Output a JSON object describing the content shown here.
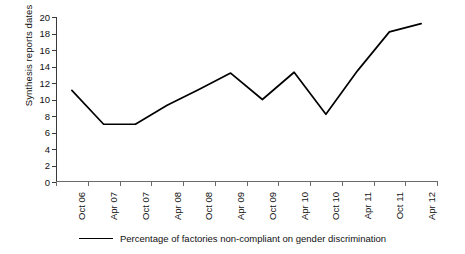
{
  "chart_data": {
    "type": "line",
    "title": "",
    "xlabel": "",
    "ylabel": "Synthesis reports dates",
    "ylim": [
      0,
      20
    ],
    "ytick_step": 2,
    "yticks": [
      20,
      18,
      16,
      14,
      12,
      10,
      8,
      6,
      4,
      2,
      0
    ],
    "grid": false,
    "legend_position": "bottom",
    "categories": [
      "Oct 06",
      "Apr 07",
      "Oct 07",
      "Apr 08",
      "Oct 08",
      "Apr 09",
      "Oct 09",
      "Apr 10",
      "Oct 10",
      "Apr 11",
      "Oct 11",
      "Apr 12"
    ],
    "series": [
      {
        "name": "Percentage of factories non-compliant on gender discrimination",
        "color": "#000000",
        "values": [
          11.1,
          7.0,
          7.0,
          9.3,
          11.2,
          13.2,
          10.0,
          13.3,
          8.2,
          13.5,
          18.2,
          19.2
        ]
      }
    ]
  },
  "axes": {
    "y_title": "Synthesis reports dates"
  },
  "legend": {
    "entries": [
      {
        "label": "Percentage of factories non-compliant on gender discrimination",
        "color": "#000000"
      }
    ]
  }
}
